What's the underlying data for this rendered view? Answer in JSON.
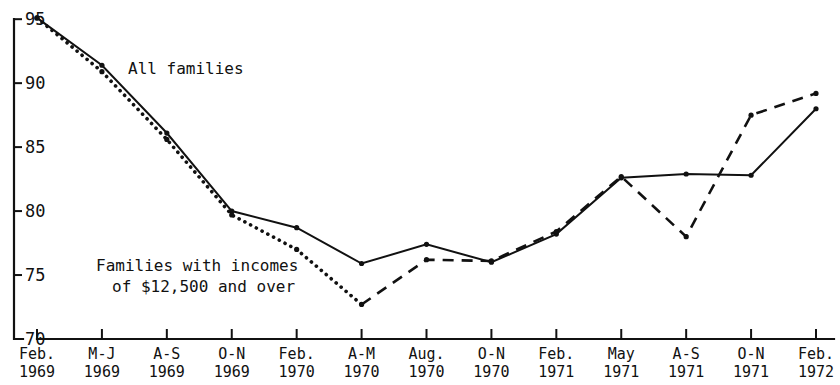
{
  "chart_data": {
    "type": "line",
    "title": "",
    "subtitle": "",
    "xlabel": "",
    "ylabel": "",
    "ylim": [
      70,
      96.5
    ],
    "yticks": [
      70,
      75,
      80,
      85,
      90,
      95
    ],
    "ytick_labels": [
      "70",
      "75",
      "80",
      "85",
      "90",
      "95"
    ],
    "grid": false,
    "legend_position": "inline-annotations",
    "categories": [
      "Feb. 1969",
      "M-J 1969",
      "A-S 1969",
      "O-N 1969",
      "Feb. 1970",
      "A-M 1970",
      "Aug. 1970",
      "O-N 1970",
      "Feb. 1971",
      "May 1971",
      "A-S 1971",
      "O-N 1971",
      "Feb. 1972"
    ],
    "xtick_labels": [
      {
        "line1": "Feb.",
        "line2": "1969"
      },
      {
        "line1": "M-J",
        "line2": "1969"
      },
      {
        "line1": "A-S",
        "line2": "1969"
      },
      {
        "line1": "O-N",
        "line2": "1969"
      },
      {
        "line1": "Feb.",
        "line2": "1970"
      },
      {
        "line1": "A-M",
        "line2": "1970"
      },
      {
        "line1": "Aug.",
        "line2": "1970"
      },
      {
        "line1": "O-N",
        "line2": "1970"
      },
      {
        "line1": "Feb.",
        "line2": "1971"
      },
      {
        "line1": "May",
        "line2": "1971"
      },
      {
        "line1": "A-S",
        "line2": "1971"
      },
      {
        "line1": "O-N",
        "line2": "1971"
      },
      {
        "line1": "Feb.",
        "line2": "1972"
      }
    ],
    "series": [
      {
        "name": "All families",
        "style": "solid",
        "color": "#111111",
        "markers": true,
        "values": [
          95.1,
          91.4,
          86.1,
          80.0,
          78.7,
          75.9,
          77.4,
          76.0,
          78.2,
          82.6,
          82.9,
          82.8,
          88.0
        ]
      },
      {
        "name": "Families with incomes of $12,500 and over",
        "style": "dotted-then-dashed",
        "color": "#111111",
        "markers": true,
        "dotted_through_index": 5,
        "values": [
          95.1,
          90.9,
          85.6,
          79.7,
          77.0,
          72.7,
          76.2,
          76.1,
          78.4,
          82.7,
          78.0,
          87.5,
          89.2
        ]
      }
    ],
    "annotations": [
      {
        "id": "all-families-label",
        "text": "All families",
        "x_px": 128,
        "y_px": 74
      },
      {
        "id": "high-income-label-line1",
        "text": "Families with incomes",
        "x_px": 96,
        "y_px": 271
      },
      {
        "id": "high-income-label-line2",
        "text": "of $12,500 and over",
        "x_px": 112,
        "y_px": 292
      }
    ],
    "axis_geometry": {
      "plot_left_px": 37,
      "plot_right_px": 816,
      "y_top_value": 96.5,
      "y_top_px": 0,
      "y_bottom_value": 70,
      "y_bottom_px": 339,
      "category_step_px": 64.9
    }
  }
}
